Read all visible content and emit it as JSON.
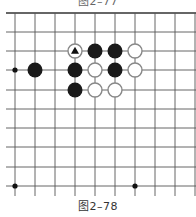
{
  "captions": {
    "top": "图2–77",
    "bottom": "图2–78"
  },
  "board": {
    "x_lines": [
      15,
      35,
      55,
      75,
      95,
      115,
      135,
      155,
      175,
      195
    ],
    "y_lines": [
      13,
      32,
      51,
      70,
      90,
      109,
      128,
      147,
      167,
      186
    ],
    "line_left": 6,
    "line_right": 196,
    "line_top": 13,
    "line_bottom": 196,
    "line_color": "#555555",
    "top_edge_color": "#333333",
    "stone_radius": 7.5,
    "star_points": [
      {
        "col": 0,
        "row": 3
      },
      {
        "col": 0,
        "row": 9
      },
      {
        "col": 6,
        "row": 9
      }
    ],
    "stones": [
      {
        "col": 3,
        "row": 2,
        "color": "white",
        "marker": "triangle"
      },
      {
        "col": 4,
        "row": 2,
        "color": "black"
      },
      {
        "col": 5,
        "row": 2,
        "color": "black"
      },
      {
        "col": 6,
        "row": 2,
        "color": "white"
      },
      {
        "col": 1,
        "row": 3,
        "color": "black"
      },
      {
        "col": 3,
        "row": 3,
        "color": "black"
      },
      {
        "col": 4,
        "row": 3,
        "color": "white"
      },
      {
        "col": 5,
        "row": 3,
        "color": "black"
      },
      {
        "col": 6,
        "row": 3,
        "color": "white"
      },
      {
        "col": 3,
        "row": 4,
        "color": "black"
      },
      {
        "col": 4,
        "row": 4,
        "color": "white"
      },
      {
        "col": 5,
        "row": 4,
        "color": "white"
      }
    ],
    "colors": {
      "black_stone": "#1a1a1a",
      "white_stone_fill": "#ffffff",
      "white_stone_stroke": "#888888",
      "marker": "#111111"
    }
  }
}
